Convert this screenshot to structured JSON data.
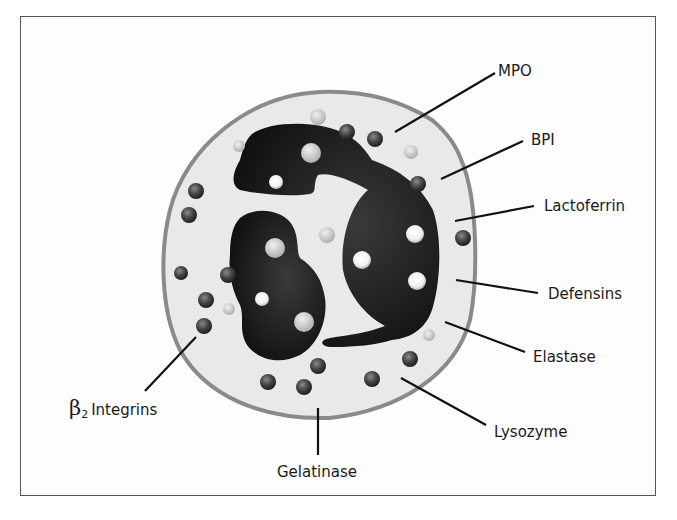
{
  "figure": {
    "colors": {
      "frame": "#555555",
      "cytoplasm": "#e9e9e9",
      "membrane": "#8a8a8a",
      "nucleus": "#111111",
      "leader_line": "#111111",
      "dark_granule": "#3f3f3f",
      "light_granule": "#c8c8c8",
      "white_granule": "#f2f2f2"
    }
  },
  "labels": {
    "mpo": "MPO",
    "bpi": "BPI",
    "lactoferrin": "Lactoferrin",
    "defensins": "Defensins",
    "elastase": "Elastase",
    "lysozyme": "Lysozyme",
    "gelatinase": "Gelatinase",
    "beta_symbol": "β",
    "beta_subscript": "2",
    "integrins": "Integrins"
  }
}
